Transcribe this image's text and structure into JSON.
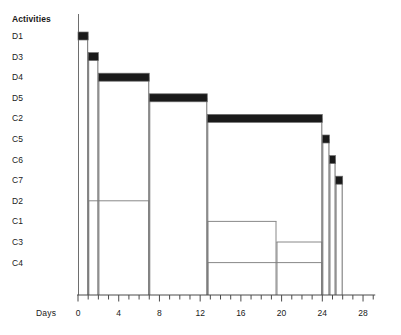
{
  "header": {
    "activities_label": "Activities",
    "days_label": "Days"
  },
  "caption": {
    "text": ""
  },
  "colors": {
    "bar_fill": "#1a1a1a",
    "bar_outline": "#6e6e6e",
    "thin_line": "#7a7a7a",
    "axis": "#4a4a4a",
    "background": "#ffffff",
    "text": "#1a1a1a"
  },
  "chart_data": {
    "type": "bar",
    "title": "",
    "subtitle": "",
    "xlabel": "Days",
    "ylabel": "Activities",
    "orientation": "horizontal",
    "grid": false,
    "legend": "none",
    "xlim": [
      0,
      29
    ],
    "xticks_major": [
      0,
      4,
      8,
      12,
      16,
      20,
      24,
      28
    ],
    "xtick_labels": [
      "0",
      "4",
      "8",
      "12",
      "16",
      "20",
      "24",
      "28"
    ],
    "xticks_minor_step": 1,
    "categories": [
      "D1",
      "D3",
      "D4",
      "D5",
      "C2",
      "C5",
      "C6",
      "C7",
      "D2",
      "C1",
      "C3",
      "C4"
    ],
    "bars": [
      {
        "label": "D1",
        "start": 0,
        "end": 1,
        "duration": 1,
        "style": "critical"
      },
      {
        "label": "D3",
        "start": 1,
        "end": 2,
        "duration": 1,
        "style": "critical"
      },
      {
        "label": "D4",
        "start": 2,
        "end": 7,
        "duration": 5,
        "style": "critical"
      },
      {
        "label": "D5",
        "start": 7,
        "end": 12.7,
        "duration": 5.7,
        "style": "critical"
      },
      {
        "label": "C2",
        "start": 12.7,
        "end": 24,
        "duration": 11.3,
        "style": "critical"
      },
      {
        "label": "C5",
        "start": 24,
        "end": 24.7,
        "duration": 0.7,
        "style": "critical"
      },
      {
        "label": "C6",
        "start": 24.7,
        "end": 25.3,
        "duration": 0.6,
        "style": "critical"
      },
      {
        "label": "C7",
        "start": 25.3,
        "end": 26,
        "duration": 0.7,
        "style": "critical"
      },
      {
        "label": "D2",
        "start": 1,
        "end": 7,
        "duration": 6,
        "style": "noncritical"
      },
      {
        "label": "C1",
        "start": 12.7,
        "end": 19.5,
        "duration": 6.8,
        "style": "noncritical"
      },
      {
        "label": "C3",
        "start": 19.5,
        "end": 24,
        "duration": 4.5,
        "style": "noncritical"
      },
      {
        "label": "C4",
        "start": 12.7,
        "end": 24,
        "duration": 11.3,
        "style": "noncritical"
      }
    ]
  }
}
